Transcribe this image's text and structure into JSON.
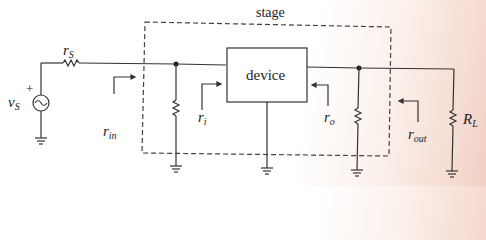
{
  "diagram": {
    "title": "stage",
    "device_label": "device",
    "labels": {
      "rs": {
        "main": "r",
        "sub": "S"
      },
      "vs": {
        "main": "v",
        "sub": "S"
      },
      "vs_polarity": "+",
      "rin": {
        "main": "r",
        "sub": "in"
      },
      "ri": {
        "main": "r",
        "sub": "i"
      },
      "ro": {
        "main": "r",
        "sub": "o"
      },
      "rout": {
        "main": "r",
        "sub": "out"
      },
      "rl": {
        "main": "R",
        "sub": "L"
      }
    },
    "components": [
      "source resistor rS",
      "voltage source vS",
      "input shunt resistor",
      "device",
      "output shunt resistor",
      "load resistor RL"
    ],
    "colors": {
      "line": "#333333",
      "dashed": "#444444"
    }
  }
}
